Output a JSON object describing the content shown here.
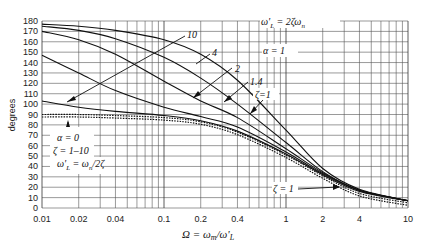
{
  "chart_data": {
    "type": "line",
    "title": "",
    "xlabel": "Ω = ω_m/ω'_L",
    "ylabel": "degrees",
    "xscale": "log",
    "xlim": [
      0.01,
      10
    ],
    "ylim": [
      0,
      180
    ],
    "grid": true,
    "x_ticks": [
      "0.01",
      "0.02",
      "0.04",
      "0.1",
      "0.2",
      "0.4",
      "1",
      "2",
      "4",
      "10"
    ],
    "y_ticks": [
      "0",
      "10",
      "20",
      "30",
      "40",
      "50",
      "60",
      "70",
      "80",
      "90",
      "100",
      "110",
      "120",
      "130",
      "140",
      "150",
      "160",
      "170",
      "180"
    ],
    "annotations": [
      {
        "text": "ω'_L = 2ζω_n",
        "group": "α = 1"
      },
      {
        "text": "α = 1"
      },
      {
        "text": "α = 0"
      },
      {
        "text": "ζ = 1–10"
      },
      {
        "text": "ω'_L = ω_n/2ζ"
      },
      {
        "text": "ζ = 1",
        "note": "lower dotted curve label"
      }
    ],
    "series": [
      {
        "name": "α=1, ζ=10",
        "label": "10",
        "x": [
          0.01,
          0.02,
          0.04,
          0.1,
          0.2,
          0.4,
          1,
          2,
          4,
          10
        ],
        "y": [
          177,
          175,
          171,
          162,
          148,
          123,
          75,
          38,
          18,
          7
        ]
      },
      {
        "name": "α=1, ζ=4",
        "label": "4",
        "x": [
          0.01,
          0.02,
          0.04,
          0.1,
          0.2,
          0.4,
          1,
          2,
          4,
          10
        ],
        "y": [
          175,
          171,
          163,
          145,
          125,
          100,
          63,
          35,
          17,
          7
        ]
      },
      {
        "name": "α=1, ζ=2",
        "label": "2",
        "x": [
          0.01,
          0.02,
          0.04,
          0.1,
          0.2,
          0.4,
          1,
          2,
          4,
          10
        ],
        "y": [
          170,
          162,
          148,
          122,
          103,
          87,
          57,
          34,
          17,
          7
        ]
      },
      {
        "name": "α=1, ζ=1.4",
        "label": "1.4",
        "x": [
          0.01,
          0.02,
          0.04,
          0.1,
          0.2,
          0.4,
          1,
          2,
          4,
          10
        ],
        "y": [
          147,
          130,
          113,
          97,
          88,
          78,
          54,
          33,
          17,
          7
        ]
      },
      {
        "name": "α=1, ζ=1",
        "label": "ζ=1",
        "x": [
          0.01,
          0.02,
          0.04,
          0.1,
          0.2,
          0.4,
          1,
          2,
          4,
          10
        ],
        "y": [
          103,
          97,
          93,
          89,
          84,
          74,
          52,
          32,
          16,
          7
        ]
      },
      {
        "name": "α=0, ζ=1–10",
        "label": "α=0",
        "style": "dotted",
        "x": [
          0.01,
          0.02,
          0.04,
          0.1,
          0.2,
          0.4,
          1,
          2,
          4,
          10
        ],
        "y": [
          90,
          90,
          89,
          87,
          83,
          73,
          51,
          31,
          14,
          5
        ]
      }
    ]
  },
  "axis": {
    "ylabel": "degrees",
    "xlabel_main": "Ω = ω",
    "xlabel_sub_m": "m",
    "xlabel_slash": "/ω'",
    "xlabel_sub_L": "L"
  },
  "labels": {
    "omega_top": "ω'",
    "omega_top_sub": "L",
    "omega_top_eq": " = 2ζω",
    "omega_top_n": "n",
    "alpha1": "α = 1",
    "z10": "10",
    "z4": "4",
    "z2": "2",
    "z14": "1.4",
    "z1": "ζ=1",
    "alpha0": "α = 0",
    "zrange": "ζ = 1–10",
    "omega_bot": "ω'",
    "omega_bot_sub": "L",
    "omega_bot_eq": " = ω",
    "omega_bot_n": "n",
    "omega_bot_tail": "/2ζ",
    "zeta1_low": "ζ = 1"
  }
}
